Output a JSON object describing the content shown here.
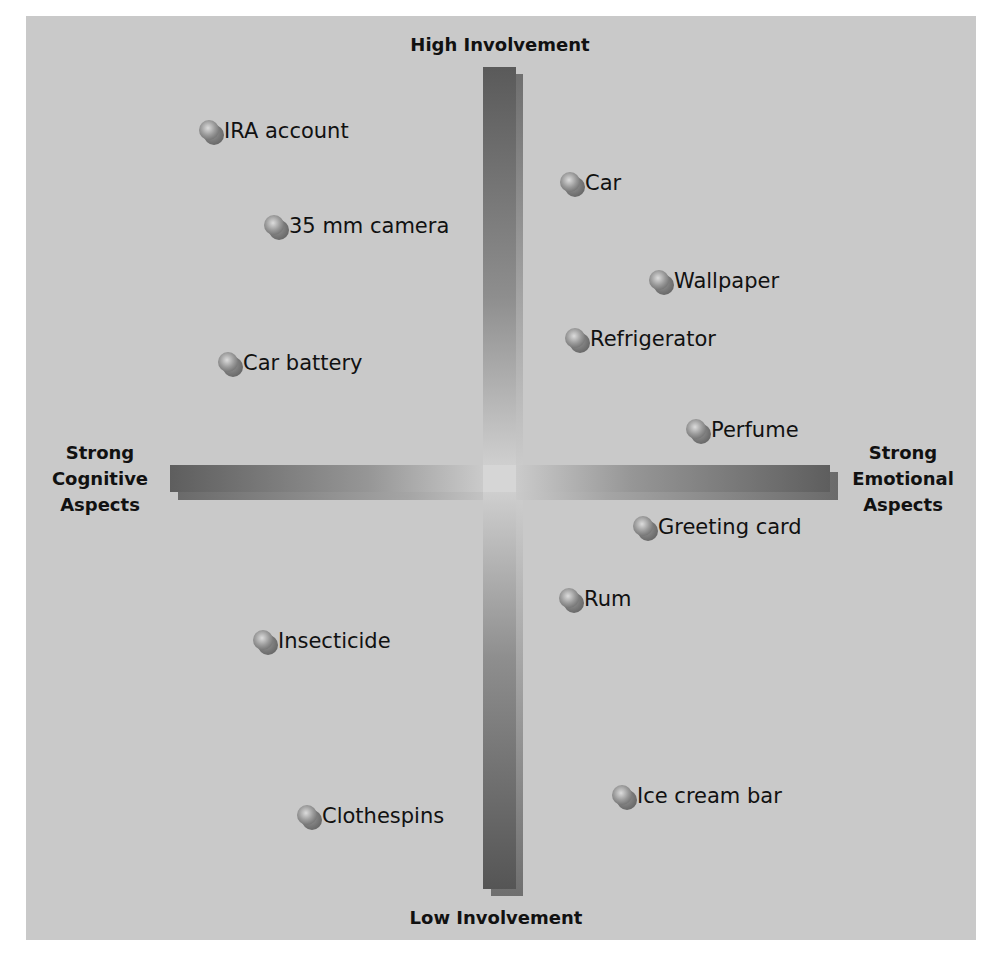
{
  "axes": {
    "top": "High Involvement",
    "bottom": "Low Involvement",
    "left": [
      "Strong",
      "Cognitive",
      "Aspects"
    ],
    "right": [
      "Strong",
      "Emotional",
      "Aspects"
    ]
  },
  "items": [
    {
      "label": "IRA account",
      "x": 210,
      "y": 131
    },
    {
      "label": "Car",
      "x": 571,
      "y": 183
    },
    {
      "label": "35 mm camera",
      "x": 275,
      "y": 226
    },
    {
      "label": "Wallpaper",
      "x": 660,
      "y": 281
    },
    {
      "label": "Refrigerator",
      "x": 576,
      "y": 339
    },
    {
      "label": "Car battery",
      "x": 229,
      "y": 363
    },
    {
      "label": "Perfume",
      "x": 697,
      "y": 430
    },
    {
      "label": "Greeting card",
      "x": 644,
      "y": 527
    },
    {
      "label": "Rum",
      "x": 570,
      "y": 599
    },
    {
      "label": "Insecticide",
      "x": 264,
      "y": 641
    },
    {
      "label": "Ice cream bar",
      "x": 623,
      "y": 796
    },
    {
      "label": "Clothespins",
      "x": 308,
      "y": 816
    }
  ],
  "colors": {
    "panel": "#c9c9c9",
    "bar_dark": "#5a5a5a",
    "bar_light": "#d4d4d4",
    "text": "#111111"
  }
}
